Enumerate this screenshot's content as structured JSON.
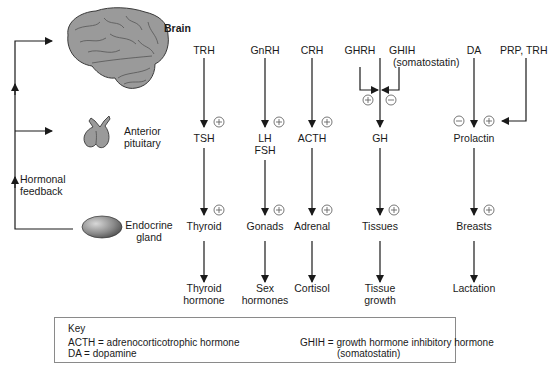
{
  "organs": {
    "brain": "Brain",
    "pituitary_line1": "Anterior",
    "pituitary_line2": "pituitary",
    "gland_line1": "Endocrine",
    "gland_line2": "gland"
  },
  "feedback": {
    "line1": "Hormonal",
    "line2": "feedback"
  },
  "columns": [
    {
      "releasing": "TRH",
      "pituitary": "TSH",
      "target": "Thyroid",
      "effect_line1": "Thyroid",
      "effect_line2": "hormone"
    },
    {
      "releasing": "GnRH",
      "pituitary_line1": "LH",
      "pituitary_line2": "FSH",
      "target": "Gonads",
      "effect_line1": "Sex",
      "effect_line2": "hormones"
    },
    {
      "releasing": "CRH",
      "pituitary": "ACTH",
      "target": "Adrenal",
      "effect_line1": "Cortisol"
    },
    {
      "releasing": "GHRH",
      "inhibiting_line1": "GHIH",
      "inhibiting_line2": "(somatostatin)",
      "pituitary": "GH",
      "target": "Tissues",
      "effect_line1": "Tissue",
      "effect_line2": "growth"
    },
    {
      "releasing_inhibit": "DA",
      "releasing": "PRP, TRH",
      "pituitary": "Prolactin",
      "target": "Breasts",
      "effect_line1": "Lactation"
    }
  ],
  "signs": {
    "plus": "+",
    "minus": "−"
  },
  "key": {
    "title": "Key",
    "acth": "ACTH = adrenocorticotrophic hormone",
    "da": "DA = dopamine",
    "ghih_line1": "GHIH = growth hormone inhibitory hormone",
    "ghih_line2": "(somatostatin)"
  },
  "colors": {
    "line": "#1a1a1a",
    "organ_gray": "#9a9a9a",
    "key_border": "#8a8a8a"
  }
}
